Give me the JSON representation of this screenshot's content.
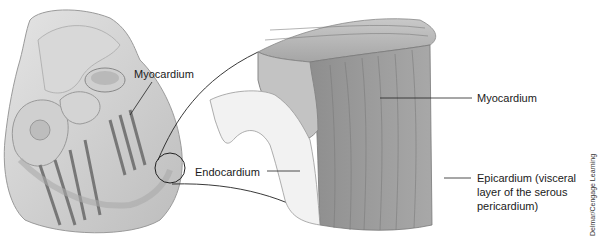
{
  "figure": {
    "left_view": "cutaway heart",
    "right_view": "enlarged block of heart wall tissue",
    "labels": {
      "myocardium_left": "Myocardium",
      "endocardium": "Endocardium",
      "myocardium_right": "Myocardium",
      "epicardium_line1": "Epicardium (visceral",
      "epicardium_line2": "layer of the serous",
      "epicardium_line3": "pericardium)"
    },
    "credit": "Delmar/Cengage Learning"
  }
}
